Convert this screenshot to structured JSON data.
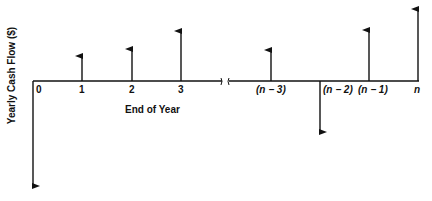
{
  "diagram": {
    "type": "cash-flow-diagram",
    "y_axis_label": "Yearly Cash Flow ($)",
    "x_axis_label": "End of Year",
    "colors": {
      "line": "#111111",
      "background": "#ffffff"
    },
    "ticks": [
      {
        "label": "0",
        "direction": "down",
        "length": 105
      },
      {
        "label": "1",
        "direction": "up",
        "length": 25
      },
      {
        "label": "2",
        "direction": "up",
        "length": 32
      },
      {
        "label": "3",
        "direction": "up",
        "length": 50
      },
      {
        "label": "(n − 3)",
        "direction": "up",
        "length": 31
      },
      {
        "label": "(n − 2)",
        "direction": "down",
        "length": 51
      },
      {
        "label": "(n − 1)",
        "direction": "up",
        "length": 51
      },
      {
        "label": "n",
        "direction": "up",
        "length": 72
      }
    ],
    "axis_break": "≈"
  }
}
